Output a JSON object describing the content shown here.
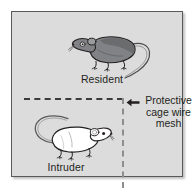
{
  "figure": {
    "type": "resident-intruder-cage-diagram",
    "background_color": "#ffffff",
    "panel": {
      "background_color": "#dcdcdc",
      "border_color": "#58595b"
    }
  },
  "compartments": {
    "resident": {
      "label": "Resident",
      "animal": "mouse",
      "fur_color": "#808285",
      "facing": "left"
    },
    "intruder": {
      "label": "Intruder",
      "animal": "mouse",
      "fur_color": "#ffffff",
      "facing": "right"
    }
  },
  "divider": {
    "horizontal_line_style": "dashed",
    "horizontal_line_color": "#3b3b3d",
    "vertical_line_style": "dashed",
    "vertical_line_color": "#8e8e90"
  },
  "callout": {
    "arrow_icon": "arrow-left-icon",
    "arrow_direction": "left",
    "lines": [
      "Protective",
      "cage wire",
      "mesh"
    ],
    "text": "Protective cage wire mesh"
  }
}
